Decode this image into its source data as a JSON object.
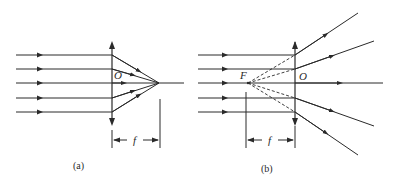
{
  "panels": [
    {
      "id": "a",
      "caption": "(a)",
      "lens_type": "converging",
      "center_label": "O",
      "focal_label": "f",
      "focal_dimension_label": "f"
    },
    {
      "id": "b",
      "caption": "(b)",
      "lens_type": "diverging",
      "center_label": "O",
      "focus_label": "F",
      "focal_dimension_label": "f"
    }
  ],
  "colors": {
    "line": "#2a2a2a",
    "background": "#ffffff"
  }
}
